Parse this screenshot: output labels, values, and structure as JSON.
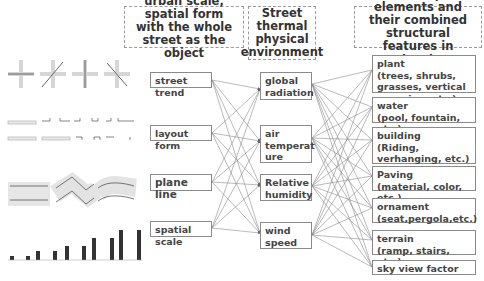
{
  "headers": {
    "left": "urban scale, spatial form with the whole street as the object",
    "middle": "Street thermal physical environment",
    "right": "landscape elements and their combined structural features in streets"
  },
  "left_column": [
    {
      "id": "street-trend",
      "label": "street trend"
    },
    {
      "id": "layout-form",
      "label": "layout form"
    },
    {
      "id": "plane-line",
      "label": "plane line"
    },
    {
      "id": "spatial-scale",
      "label": "spatial scale"
    }
  ],
  "middle_column": [
    {
      "id": "global-radiation",
      "line1": "global",
      "line2": "radiation",
      "line3": ""
    },
    {
      "id": "air-temperature",
      "line1": "air",
      "line2": "temperat",
      "line3": "ure"
    },
    {
      "id": "relative-humidity",
      "line1": "Relative",
      "line2": "humidity",
      "line3": ""
    },
    {
      "id": "wind-speed",
      "line1": "wind",
      "line2": "speed",
      "line3": ""
    }
  ],
  "right_column": [
    {
      "id": "plant",
      "title": "plant",
      "detail": "(trees, shrubs, grasses, vertical greening, etc.)"
    },
    {
      "id": "water",
      "title": "water",
      "detail": "(pool, fountain, etc.)"
    },
    {
      "id": "building",
      "title": "building",
      "detail": "(Riding, verhanging, etc.)"
    },
    {
      "id": "paving",
      "title": "Paving",
      "detail": "(material, color, etc.)"
    },
    {
      "id": "ornament",
      "title": "ornament",
      "detail": "(seat,pergola,etc.)"
    },
    {
      "id": "terrain",
      "title": "terrain",
      "detail": "(ramp, stairs, etc.)"
    },
    {
      "id": "sky-view-factor",
      "title": "sky view factor",
      "detail": ""
    }
  ],
  "illustrations": {
    "street_trend": "four crossing-street orientation icons",
    "layout_form": "street enclosure layout strips",
    "plane_line": "straight, zigzag and curved street plans",
    "spatial_scale": "bar pairs of increasing height"
  },
  "colors": {
    "line": "#8c8c8c",
    "box_border": "#8a8a8a",
    "text": "#444444",
    "bar": "#333333",
    "shade": "#e3e3e3"
  }
}
